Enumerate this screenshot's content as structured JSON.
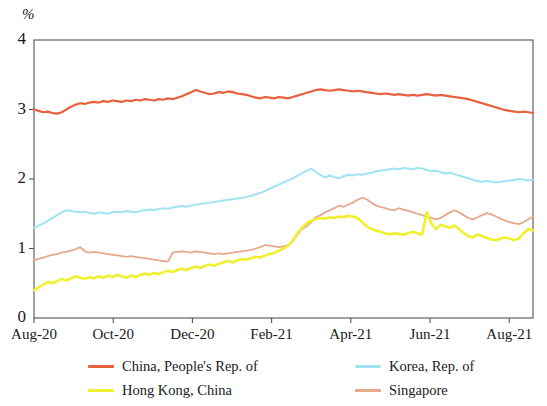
{
  "figure": {
    "unit_label": "%",
    "background": "#ffffff"
  },
  "chart_data": {
    "type": "line",
    "title": "",
    "subtitle": "",
    "xlabel": "",
    "ylabel": "%",
    "ylim": [
      0,
      4
    ],
    "xlim": [
      "Aug-20",
      "Aug-21"
    ],
    "grid": false,
    "legend_position": "bottom",
    "ytick_labels": [
      "0",
      "1",
      "2",
      "3",
      "4"
    ],
    "ytick_values": [
      0,
      1,
      2,
      3,
      4
    ],
    "xtick_labels": [
      "Aug-20",
      "Oct-20",
      "Dec-20",
      "Feb-21",
      "Apr-21",
      "Jun-21",
      "Aug-21"
    ],
    "xtick_positions": [
      0,
      2,
      4,
      6,
      8,
      10,
      12
    ],
    "x_months_total": 12.6,
    "series": [
      {
        "name": "China, People's Rep. of",
        "color": "#e8603c",
        "width": 2.2,
        "values": [
          3.0,
          2.98,
          2.96,
          2.97,
          2.95,
          2.94,
          2.96,
          3.0,
          3.04,
          3.07,
          3.09,
          3.08,
          3.1,
          3.11,
          3.1,
          3.12,
          3.11,
          3.13,
          3.12,
          3.11,
          3.13,
          3.12,
          3.14,
          3.13,
          3.15,
          3.14,
          3.13,
          3.15,
          3.14,
          3.16,
          3.15,
          3.17,
          3.19,
          3.22,
          3.25,
          3.28,
          3.26,
          3.24,
          3.22,
          3.23,
          3.25,
          3.24,
          3.26,
          3.25,
          3.23,
          3.22,
          3.21,
          3.19,
          3.17,
          3.16,
          3.18,
          3.17,
          3.16,
          3.18,
          3.17,
          3.16,
          3.18,
          3.2,
          3.22,
          3.24,
          3.26,
          3.28,
          3.29,
          3.28,
          3.27,
          3.28,
          3.29,
          3.28,
          3.27,
          3.26,
          3.27,
          3.26,
          3.25,
          3.24,
          3.23,
          3.22,
          3.23,
          3.22,
          3.21,
          3.22,
          3.21,
          3.2,
          3.21,
          3.2,
          3.21,
          3.22,
          3.21,
          3.2,
          3.21,
          3.2,
          3.19,
          3.18,
          3.17,
          3.16,
          3.15,
          3.13,
          3.11,
          3.09,
          3.07,
          3.05,
          3.03,
          3.01,
          2.99,
          2.98,
          2.97,
          2.96,
          2.97,
          2.96,
          2.95
        ],
        "start_value": 3.0,
        "end_value": 2.95,
        "max_value": 3.35,
        "min_value": 2.93
      },
      {
        "name": "Korea, Rep. of",
        "color": "#9fe4f0",
        "width": 2.0,
        "values": [
          1.3,
          1.33,
          1.36,
          1.4,
          1.44,
          1.48,
          1.52,
          1.55,
          1.54,
          1.53,
          1.52,
          1.53,
          1.51,
          1.5,
          1.52,
          1.51,
          1.5,
          1.52,
          1.53,
          1.52,
          1.54,
          1.53,
          1.52,
          1.54,
          1.55,
          1.56,
          1.55,
          1.57,
          1.58,
          1.57,
          1.59,
          1.6,
          1.61,
          1.6,
          1.62,
          1.63,
          1.64,
          1.65,
          1.66,
          1.67,
          1.68,
          1.69,
          1.7,
          1.71,
          1.72,
          1.73,
          1.74,
          1.76,
          1.78,
          1.8,
          1.83,
          1.86,
          1.89,
          1.92,
          1.95,
          1.98,
          2.01,
          2.05,
          2.08,
          2.12,
          2.15,
          2.1,
          2.06,
          2.02,
          2.05,
          2.03,
          2.01,
          2.04,
          2.06,
          2.05,
          2.07,
          2.06,
          2.08,
          2.09,
          2.11,
          2.12,
          2.13,
          2.14,
          2.15,
          2.14,
          2.16,
          2.15,
          2.14,
          2.16,
          2.15,
          2.13,
          2.11,
          2.12,
          2.1,
          2.08,
          2.09,
          2.07,
          2.05,
          2.03,
          2.01,
          1.99,
          1.97,
          1.96,
          1.97,
          1.96,
          1.95,
          1.96,
          1.97,
          1.98,
          1.99,
          2.0,
          1.99,
          1.98,
          1.99
        ],
        "start_value": 1.3,
        "end_value": 1.99,
        "max_value": 2.17,
        "min_value": 1.29
      },
      {
        "name": "Singapore",
        "color": "#e6a98b",
        "width": 1.8,
        "values": [
          0.83,
          0.85,
          0.87,
          0.89,
          0.91,
          0.92,
          0.94,
          0.95,
          0.97,
          0.99,
          1.02,
          0.96,
          0.94,
          0.95,
          0.94,
          0.93,
          0.92,
          0.91,
          0.9,
          0.89,
          0.88,
          0.89,
          0.88,
          0.87,
          0.86,
          0.85,
          0.84,
          0.83,
          0.82,
          0.81,
          0.94,
          0.95,
          0.96,
          0.95,
          0.94,
          0.96,
          0.95,
          0.94,
          0.93,
          0.92,
          0.93,
          0.92,
          0.93,
          0.94,
          0.95,
          0.96,
          0.97,
          0.98,
          1.0,
          1.02,
          1.05,
          1.04,
          1.03,
          1.02,
          1.03,
          1.05,
          1.1,
          1.2,
          1.28,
          1.32,
          1.38,
          1.45,
          1.48,
          1.52,
          1.55,
          1.58,
          1.62,
          1.6,
          1.63,
          1.66,
          1.7,
          1.73,
          1.71,
          1.66,
          1.62,
          1.6,
          1.58,
          1.56,
          1.55,
          1.58,
          1.56,
          1.54,
          1.52,
          1.5,
          1.48,
          1.46,
          1.44,
          1.42,
          1.44,
          1.48,
          1.52,
          1.55,
          1.52,
          1.48,
          1.44,
          1.42,
          1.45,
          1.48,
          1.51,
          1.49,
          1.46,
          1.43,
          1.4,
          1.38,
          1.36,
          1.35,
          1.38,
          1.42,
          1.46
        ],
        "start_value": 0.83,
        "end_value": 1.46,
        "max_value": 1.73,
        "min_value": 0.81
      },
      {
        "name": "Hong Kong, China",
        "color": "#f0f02c",
        "width": 2.6,
        "values": [
          0.4,
          0.44,
          0.48,
          0.52,
          0.5,
          0.53,
          0.56,
          0.54,
          0.57,
          0.6,
          0.58,
          0.56,
          0.59,
          0.57,
          0.6,
          0.58,
          0.61,
          0.59,
          0.62,
          0.6,
          0.58,
          0.61,
          0.59,
          0.62,
          0.64,
          0.62,
          0.65,
          0.63,
          0.66,
          0.68,
          0.66,
          0.69,
          0.71,
          0.69,
          0.72,
          0.74,
          0.72,
          0.75,
          0.77,
          0.75,
          0.78,
          0.8,
          0.82,
          0.8,
          0.83,
          0.85,
          0.84,
          0.86,
          0.88,
          0.87,
          0.9,
          0.92,
          0.94,
          0.97,
          1.0,
          1.04,
          1.12,
          1.22,
          1.3,
          1.36,
          1.4,
          1.42,
          1.44,
          1.43,
          1.45,
          1.44,
          1.46,
          1.45,
          1.47,
          1.46,
          1.44,
          1.38,
          1.32,
          1.28,
          1.26,
          1.24,
          1.22,
          1.2,
          1.22,
          1.21,
          1.2,
          1.22,
          1.24,
          1.22,
          1.2,
          1.52,
          1.36,
          1.28,
          1.34,
          1.32,
          1.3,
          1.33,
          1.28,
          1.22,
          1.18,
          1.16,
          1.2,
          1.18,
          1.15,
          1.13,
          1.12,
          1.14,
          1.16,
          1.14,
          1.12,
          1.15,
          1.22,
          1.28,
          1.26
        ],
        "start_value": 0.4,
        "end_value": 1.26,
        "max_value": 1.52,
        "min_value": 0.38
      }
    ]
  },
  "legend": {
    "items": [
      {
        "label": "China, People's Rep. of",
        "color": "#e8603c",
        "column": 0,
        "row": 0
      },
      {
        "label": "Hong Kong, China",
        "color": "#f0f02c",
        "column": 0,
        "row": 1
      },
      {
        "label": "Korea, Rep. of",
        "color": "#9fe4f0",
        "column": 1,
        "row": 0
      },
      {
        "label": "Singapore",
        "color": "#e6a98b",
        "column": 1,
        "row": 1
      }
    ]
  }
}
